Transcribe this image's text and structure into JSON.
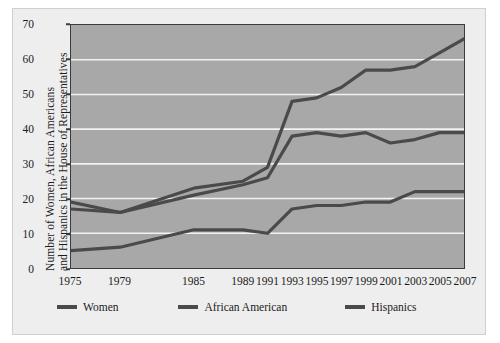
{
  "chart_data": {
    "type": "line",
    "title": "",
    "xlabel": "",
    "ylabel": "Number of Women, African Americans and Hispanics in the House of Representatives",
    "ylabel_line1": "Number of Women, African Americans",
    "ylabel_line2": "and Hispanics in the House of Representatives",
    "categories": [
      "1975",
      "1979",
      "1985",
      "1989",
      "1991",
      "1993",
      "1995",
      "1997",
      "1999",
      "2001",
      "2003",
      "2005",
      "2007"
    ],
    "x": [
      1975,
      1979,
      1985,
      1989,
      1991,
      1993,
      1995,
      1997,
      1999,
      2001,
      2003,
      2005,
      2007
    ],
    "yticks": [
      0,
      10,
      20,
      30,
      40,
      50,
      60,
      70
    ],
    "ylim": [
      0,
      70
    ],
    "xlim": [
      1975,
      2007
    ],
    "grid": true,
    "grid_color": "#f2f2f2",
    "plot_background": "#a8a8a8",
    "line_color": "#4a4a4a",
    "legend_position": "below",
    "series": [
      {
        "name": "Women",
        "values": [
          19,
          16,
          23,
          25,
          29,
          48,
          49,
          52,
          57,
          57,
          58,
          62,
          66
        ]
      },
      {
        "name": "African American",
        "values": [
          17,
          16,
          21,
          24,
          26,
          38,
          39,
          38,
          39,
          36,
          37,
          39,
          39
        ]
      },
      {
        "name": "Hispanics",
        "values": [
          5,
          6,
          11,
          11,
          10,
          17,
          18,
          18,
          19,
          19,
          22,
          22,
          22
        ]
      }
    ]
  },
  "legend": {
    "items": [
      {
        "label": "Women"
      },
      {
        "label": "African American"
      },
      {
        "label": "Hispanics"
      }
    ]
  }
}
